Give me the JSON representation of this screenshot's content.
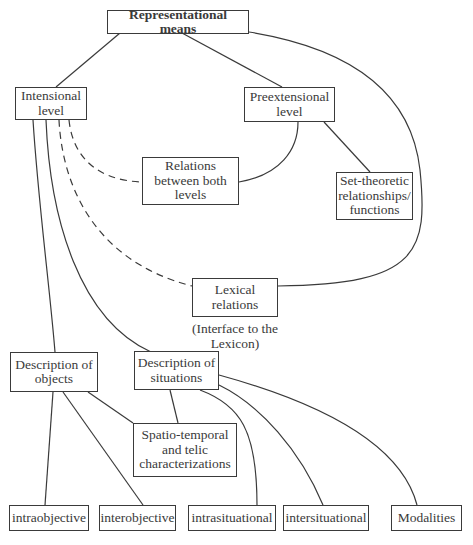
{
  "diagram": {
    "nodes": {
      "root": {
        "label": "Representational means"
      },
      "intensional": {
        "label": "Intensional\nlevel"
      },
      "preextensional": {
        "label": "Preextensional\nlevel"
      },
      "relations_both": {
        "label": "Relations\nbetween both\nlevels"
      },
      "set_theoretic": {
        "label": "Set-theoretic\nrelationships/\nfunctions"
      },
      "lexical": {
        "label": "Lexical\nrelations"
      },
      "lexical_caption": {
        "label": "(Interface to the\nLexicon)"
      },
      "desc_objects": {
        "label": "Description of\nobjects"
      },
      "desc_situations": {
        "label": "Description of\nsituations"
      },
      "spatio_temporal": {
        "label": "Spatio-temporal\nand telic\ncharacterizations"
      },
      "intraobjective": {
        "label": "intraobjective"
      },
      "interobjective": {
        "label": "interobjective"
      },
      "intrasituational": {
        "label": "intrasituational"
      },
      "intersituational": {
        "label": "intersituational"
      },
      "modalities": {
        "label": "Modalities"
      }
    },
    "edges": [
      {
        "from": "Representational means",
        "to": "Intensional level",
        "style": "solid"
      },
      {
        "from": "Representational means",
        "to": "Preextensional level",
        "style": "solid"
      },
      {
        "from": "Representational means",
        "to": "Lexical relations",
        "style": "solid"
      },
      {
        "from": "Preextensional level",
        "to": "Relations between both levels",
        "style": "solid"
      },
      {
        "from": "Preextensional level",
        "to": "Set-theoretic relationships/functions",
        "style": "solid"
      },
      {
        "from": "Intensional level",
        "to": "Relations between both levels",
        "style": "dashed"
      },
      {
        "from": "Intensional level",
        "to": "Lexical relations",
        "style": "dashed"
      },
      {
        "from": "Intensional level",
        "to": "Description of objects",
        "style": "solid"
      },
      {
        "from": "Intensional level",
        "to": "Description of situations",
        "style": "solid"
      },
      {
        "from": "Description of objects",
        "to": "intraobjective",
        "style": "solid"
      },
      {
        "from": "Description of objects",
        "to": "interobjective",
        "style": "solid"
      },
      {
        "from": "Description of objects",
        "to": "Spatio-temporal and telic characterizations",
        "style": "solid"
      },
      {
        "from": "Description of situations",
        "to": "Spatio-temporal and telic characterizations",
        "style": "solid"
      },
      {
        "from": "Description of situations",
        "to": "intrasituational",
        "style": "solid"
      },
      {
        "from": "Description of situations",
        "to": "intersituational",
        "style": "solid"
      },
      {
        "from": "Description of situations",
        "to": "Modalities",
        "style": "solid"
      }
    ]
  }
}
